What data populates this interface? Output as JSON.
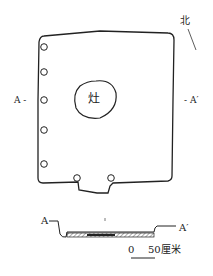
{
  "diagram": {
    "type": "archaeological house floor plan with cross-section",
    "north_label": "北",
    "hearth_label": "灶",
    "section_labels": {
      "start": "A",
      "end": "A′"
    },
    "plan_section_labels": {
      "left": "A -",
      "right": "- A′"
    },
    "scale_bar": {
      "zero": "0",
      "value": "50",
      "unit": "厘米"
    },
    "postholes_count": 8,
    "colors": {
      "line": "#222222",
      "background": "#ffffff",
      "hatch": "#555555"
    }
  }
}
